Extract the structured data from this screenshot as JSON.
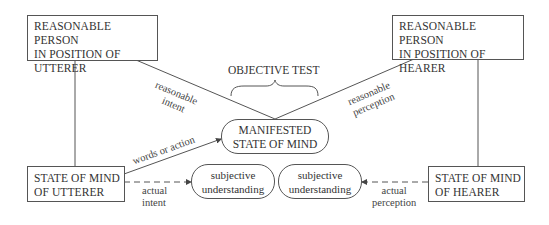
{
  "diagram": {
    "title": "OBJECTIVE TEST",
    "nodes": {
      "rp_utterer": {
        "line1": "REASONABLE PERSON",
        "line2": "IN POSITION OF",
        "line3": "UTTERER"
      },
      "rp_hearer": {
        "line1": "REASONABLE PERSON",
        "line2": "IN POSITION OF",
        "line3": "HEARER"
      },
      "som_utterer": {
        "line1": "STATE OF MIND",
        "line2": "OF UTTERER"
      },
      "som_hearer": {
        "line1": "STATE OF MIND",
        "line2": "OF HEARER"
      },
      "manifested": {
        "line1": "MANIFESTED",
        "line2": "STATE OF MIND"
      },
      "subj_left": {
        "line1": "subjective",
        "line2": "understanding"
      },
      "subj_right": {
        "line1": "subjective",
        "line2": "understanding"
      }
    },
    "edge_labels": {
      "reasonable_intent": {
        "line1": "reasonable",
        "line2": "intent"
      },
      "reasonable_perception": {
        "line1": "reasonable",
        "line2": "perception"
      },
      "words_or_action": "words or action",
      "actual_intent": {
        "line1": "actual",
        "line2": "intent"
      },
      "actual_perception": {
        "line1": "actual",
        "line2": "perception"
      }
    }
  }
}
